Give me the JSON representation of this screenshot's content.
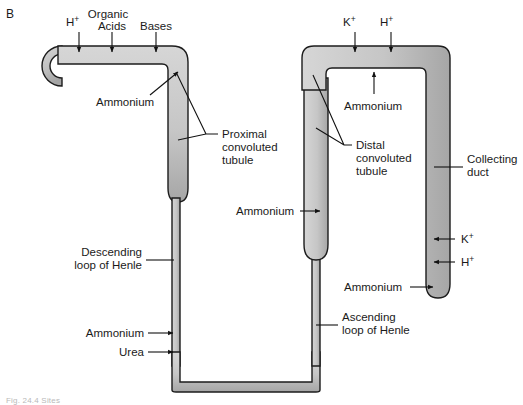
{
  "figure": {
    "panel_label": "B",
    "caption": "Fig. 24.4  Sites",
    "colors": {
      "tubule_fill_light": "#d2d2d2",
      "tubule_fill_dark": "#a9a9a9",
      "outline": "#1c1c1c",
      "text": "#1a1a1a",
      "background": "#ffffff"
    }
  },
  "structures": [
    {
      "id": "bowmans-capsule",
      "label": ""
    },
    {
      "id": "proximal-convoluted-tubule",
      "label": "Proximal\nconvoluted\ntubule"
    },
    {
      "id": "descending-loop-of-henle",
      "label": "Descending\nloop of Henle"
    },
    {
      "id": "ascending-loop-of-henle",
      "label": "Ascending\nloop of Henle"
    },
    {
      "id": "distal-convoluted-tubule",
      "label": "Distal\nconvoluted\ntubule"
    },
    {
      "id": "collecting-duct",
      "label": "Collecting\nduct"
    }
  ],
  "labels": {
    "structure": {
      "proximal_convoluted_tubule": [
        "Proximal",
        "convoluted",
        "tubule"
      ],
      "distal_convoluted_tubule": [
        "Distal",
        "convoluted",
        "tubule"
      ],
      "descending_loop_of_henle": [
        "Descending",
        "loop of Henle"
      ],
      "ascending_loop_of_henle": [
        "Ascending",
        "loop of Henle"
      ],
      "collecting_duct": [
        "Collecting",
        "duct"
      ]
    },
    "solutes": {
      "hydrogen": "H",
      "hydrogen_charge": "+",
      "potassium": "K",
      "potassium_charge": "+",
      "organic": "Organic",
      "acids": "Acids",
      "bases": "Bases",
      "ammonium": "Ammonium",
      "urea": "Urea"
    }
  },
  "annotations": [
    {
      "id": "pct-h-secretion",
      "text": "H+",
      "target": "proximal-convoluted-tubule",
      "direction": "into-tubule"
    },
    {
      "id": "pct-organic-acids",
      "text": "Organic Acids",
      "target": "proximal-convoluted-tubule",
      "direction": "into-tubule"
    },
    {
      "id": "pct-organic-bases",
      "text": "Organic Bases",
      "target": "proximal-convoluted-tubule",
      "direction": "into-tubule"
    },
    {
      "id": "pct-ammonium",
      "text": "Ammonium",
      "target": "proximal-convoluted-tubule",
      "direction": "into-tubule"
    },
    {
      "id": "descending-ammonium",
      "text": "Ammonium",
      "target": "descending-loop-of-henle",
      "direction": "into-tubule"
    },
    {
      "id": "descending-urea",
      "text": "Urea",
      "target": "descending-loop-of-henle",
      "direction": "into-tubule"
    },
    {
      "id": "ascending-ammonium",
      "text": "Ammonium",
      "target": "ascending-loop-of-henle",
      "direction": "out-of-tubule"
    },
    {
      "id": "dct-potassium",
      "text": "K+",
      "target": "distal-convoluted-tubule",
      "direction": "into-tubule"
    },
    {
      "id": "dct-hydrogen",
      "text": "H+",
      "target": "distal-convoluted-tubule",
      "direction": "into-tubule"
    },
    {
      "id": "dct-ammonium",
      "text": "Ammonium",
      "target": "distal-convoluted-tubule",
      "direction": "into-tubule"
    },
    {
      "id": "collecting-duct-potassium",
      "text": "K+",
      "target": "collecting-duct",
      "direction": "into-tubule"
    },
    {
      "id": "collecting-duct-hydrogen",
      "text": "H+",
      "target": "collecting-duct",
      "direction": "into-tubule"
    },
    {
      "id": "collecting-duct-ammonium",
      "text": "Ammonium",
      "target": "collecting-duct",
      "direction": "into-tubule"
    }
  ]
}
